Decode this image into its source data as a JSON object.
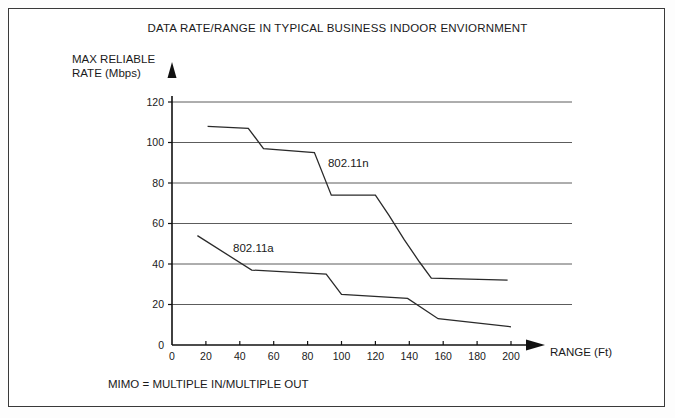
{
  "figure": {
    "title": "DATA RATE/RANGE IN TYPICAL BUSINESS INDOOR ENVIORNMENT",
    "y_axis_title_line1": "MAX RELIABLE",
    "y_axis_title_line2": "RATE (Mbps)",
    "x_axis_caption": "RANGE (Ft)",
    "footer_note": "MIMO = MULTIPLE IN/MULTIPLE OUT"
  },
  "chart_data": {
    "type": "line",
    "title": "DATA RATE/RANGE IN TYPICAL BUSINESS INDOOR ENVIORNMENT",
    "xlabel": "RANGE (Ft)",
    "ylabel": "MAX RELIABLE RATE (Mbps)",
    "xlim": [
      0,
      200
    ],
    "ylim": [
      0,
      120
    ],
    "xticks": [
      0,
      20,
      40,
      60,
      80,
      100,
      120,
      140,
      160,
      180,
      200
    ],
    "yticks": [
      0,
      20,
      40,
      60,
      80,
      100,
      120
    ],
    "xtick_labels": [
      "0",
      "20",
      "40",
      "60",
      "80",
      "100",
      "120",
      "140",
      "160",
      "180",
      "200"
    ],
    "ytick_labels": [
      "0",
      "20",
      "40",
      "60",
      "80",
      "100",
      "120"
    ],
    "grid": "horizontal",
    "legend": "inline-annotations",
    "series": [
      {
        "name": "802.11n",
        "label_x": 92,
        "label_y": 88,
        "points": [
          [
            21,
            108
          ],
          [
            45,
            107
          ],
          [
            54,
            97
          ],
          [
            84,
            95
          ],
          [
            94,
            74
          ],
          [
            120,
            74
          ],
          [
            128,
            64
          ],
          [
            137,
            52
          ],
          [
            146,
            41
          ],
          [
            153,
            33
          ],
          [
            198,
            32
          ]
        ]
      },
      {
        "name": "802.11a",
        "label_x": 36,
        "label_y": 46,
        "points": [
          [
            15,
            54
          ],
          [
            47,
            37
          ],
          [
            91,
            35
          ],
          [
            100,
            25
          ],
          [
            139,
            23
          ],
          [
            157,
            13
          ],
          [
            200,
            9
          ]
        ]
      }
    ]
  }
}
